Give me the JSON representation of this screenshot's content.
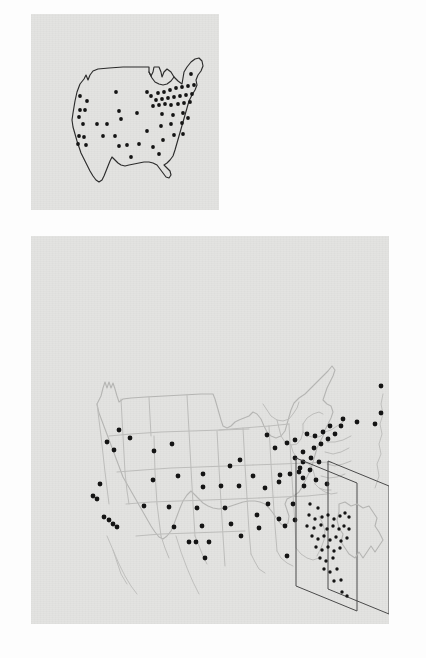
{
  "figure": {
    "title": "",
    "background_color": "#fdfdfd",
    "panel_color": "#e3e3e1",
    "dot_color": "#141414",
    "panels": [
      {
        "id": "top-panel",
        "name": "us-outline-map-with-points",
        "x": 31,
        "y": 14,
        "width": 188,
        "height": 196,
        "outline_color": "#2b2b2b",
        "point_count": 58
      },
      {
        "id": "bottom-panel",
        "name": "us-state-map-with-points-and-3d-inset",
        "x": 31,
        "y": 236,
        "width": 358,
        "height": 388,
        "outline_color": "#b5b5b3",
        "point_count": 63,
        "inset": {
          "name": "stacked-planes-inset",
          "plane_count": 2,
          "point_count": 40
        }
      }
    ]
  },
  "chart_data": {
    "type": "scatter",
    "title": "",
    "subtitle": "",
    "xlabel": "",
    "ylabel": "",
    "grid": false,
    "legend": null,
    "panels": [
      {
        "name": "top-us-outline-scatter",
        "description": "US national outline map with black point markers marking locations; dense cluster in the Northeast",
        "xlim": [
          0,
          188
        ],
        "ylim": [
          0,
          196
        ],
        "points": [
          [
            49,
            82
          ],
          [
            56,
            87
          ],
          [
            54,
            95
          ],
          [
            50,
            101
          ],
          [
            47,
            112
          ],
          [
            51,
            116
          ],
          [
            45,
            126
          ],
          [
            52,
            130
          ],
          [
            57,
            134
          ],
          [
            60,
            138
          ],
          [
            66,
            92
          ],
          [
            68,
            102
          ],
          [
            71,
            109
          ],
          [
            79,
            118
          ],
          [
            82,
            127
          ],
          [
            86,
            121
          ],
          [
            71,
            134
          ],
          [
            75,
            137
          ],
          [
            88,
            94
          ],
          [
            92,
            105
          ],
          [
            88,
            113
          ],
          [
            102,
            120
          ],
          [
            104,
            128
          ],
          [
            98,
            136
          ],
          [
            110,
            97
          ],
          [
            113,
            105
          ],
          [
            118,
            88
          ],
          [
            123,
            93
          ],
          [
            116,
            112
          ],
          [
            121,
            118
          ],
          [
            126,
            100
          ],
          [
            130,
            92
          ],
          [
            133,
            86
          ],
          [
            137,
            92
          ],
          [
            141,
            86
          ],
          [
            145,
            92
          ],
          [
            149,
            86
          ],
          [
            152,
            92
          ],
          [
            156,
            86
          ],
          [
            159,
            92
          ],
          [
            163,
            86
          ],
          [
            135,
            99
          ],
          [
            139,
            105
          ],
          [
            143,
            99
          ],
          [
            147,
            105
          ],
          [
            151,
            99
          ],
          [
            155,
            105
          ],
          [
            159,
            99
          ],
          [
            162,
            105
          ],
          [
            166,
            99
          ],
          [
            128,
            112
          ],
          [
            133,
            118
          ],
          [
            140,
            113
          ],
          [
            146,
            119
          ],
          [
            152,
            113
          ],
          [
            158,
            118
          ],
          [
            163,
            112
          ],
          [
            167,
            105
          ],
          [
            122,
            130
          ],
          [
            128,
            136
          ],
          [
            134,
            130
          ],
          [
            140,
            137
          ],
          [
            146,
            131
          ],
          [
            118,
            143
          ],
          [
            124,
            138
          ],
          [
            130,
            144
          ],
          [
            160,
            78
          ],
          [
            164,
            84
          ]
        ]
      },
      {
        "name": "bottom-us-state-scatter",
        "description": "US map with state boundaries (light gray) and black point markers; three points at upper right near Nova Scotia; isometric inset of two stacked planes with point cloud at lower right",
        "xlim": [
          0,
          358
        ],
        "ylim": [
          0,
          388
        ],
        "points": [
          [
            120,
            194
          ],
          [
            131,
            202
          ],
          [
            105,
            206
          ],
          [
            112,
            214
          ],
          [
            85,
            270
          ],
          [
            74,
            277
          ],
          [
            81,
            281
          ],
          [
            93,
            310
          ],
          [
            98,
            314
          ],
          [
            103,
            318
          ],
          [
            107,
            321
          ],
          [
            175,
            240
          ],
          [
            203,
            241
          ],
          [
            83,
            268
          ],
          [
            118,
            267
          ],
          [
            199,
            263
          ],
          [
            241,
            260
          ],
          [
            236,
            296
          ],
          [
            262,
            298
          ],
          [
            291,
            258
          ],
          [
            302,
            265
          ],
          [
            296,
            276
          ],
          [
            303,
            281
          ],
          [
            311,
            280
          ],
          [
            318,
            281
          ],
          [
            278,
            270
          ],
          [
            285,
            275
          ],
          [
            316,
            261
          ],
          [
            324,
            266
          ],
          [
            327,
            271
          ],
          [
            288,
            287
          ],
          [
            295,
            292
          ],
          [
            303,
            293
          ],
          [
            312,
            292
          ],
          [
            251,
            266
          ],
          [
            266,
            267
          ],
          [
            228,
            297
          ],
          [
            234,
            303
          ],
          [
            249,
            306
          ],
          [
            255,
            310
          ],
          [
            304,
            306
          ],
          [
            310,
            312
          ],
          [
            196,
            329
          ],
          [
            217,
            330
          ],
          [
            267,
            305
          ],
          [
            274,
            314
          ],
          [
            285,
            330
          ],
          [
            196,
            357
          ],
          [
            209,
            357
          ],
          [
            206,
            318
          ],
          [
            216,
            320
          ],
          [
            177,
            327
          ],
          [
            149,
            327
          ],
          [
            235,
            337
          ],
          [
            248,
            341
          ],
          [
            222,
            355
          ],
          [
            279,
            356
          ],
          [
            244,
            382
          ],
          [
            161,
            360
          ],
          [
            166,
            360
          ],
          [
            317,
            301
          ],
          [
            322,
            310
          ],
          [
            179,
            388
          ]
        ],
        "extra_points_nova_scotia": [
          [
            351,
            189
          ],
          [
            345,
            194
          ],
          [
            330,
            199
          ]
        ],
        "inset_points": [
          [
            24,
            48
          ],
          [
            31,
            43
          ],
          [
            39,
            48
          ],
          [
            22,
            57
          ],
          [
            30,
            56
          ],
          [
            35,
            60
          ],
          [
            43,
            57
          ],
          [
            50,
            55
          ],
          [
            57,
            52
          ],
          [
            64,
            50
          ],
          [
            70,
            48
          ],
          [
            20,
            66
          ],
          [
            27,
            64
          ],
          [
            34,
            69
          ],
          [
            41,
            66
          ],
          [
            48,
            70
          ],
          [
            55,
            67
          ],
          [
            62,
            65
          ],
          [
            69,
            70
          ],
          [
            25,
            76
          ],
          [
            32,
            80
          ],
          [
            39,
            77
          ],
          [
            46,
            81
          ],
          [
            53,
            78
          ],
          [
            60,
            82
          ],
          [
            67,
            79
          ],
          [
            30,
            90
          ],
          [
            37,
            94
          ],
          [
            44,
            91
          ],
          [
            51,
            95
          ],
          [
            58,
            92
          ],
          [
            35,
            103
          ],
          [
            42,
            107
          ],
          [
            49,
            104
          ],
          [
            40,
            116
          ],
          [
            47,
            120
          ],
          [
            52,
            130
          ],
          [
            58,
            127
          ],
          [
            63,
            140
          ],
          [
            68,
            145
          ]
        ]
      }
    ]
  }
}
